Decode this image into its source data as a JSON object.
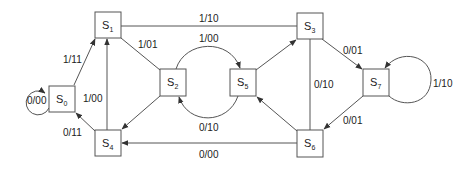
{
  "diagram": {
    "type": "state-transition-diagram",
    "nodes": [
      {
        "id": "S0",
        "letter": "S",
        "index": "0"
      },
      {
        "id": "S1",
        "letter": "S",
        "index": "1"
      },
      {
        "id": "S2",
        "letter": "S",
        "index": "2"
      },
      {
        "id": "S3",
        "letter": "S",
        "index": "3"
      },
      {
        "id": "S4",
        "letter": "S",
        "index": "4"
      },
      {
        "id": "S5",
        "letter": "S",
        "index": "5"
      },
      {
        "id": "S6",
        "letter": "S",
        "index": "6"
      },
      {
        "id": "S7",
        "letter": "S",
        "index": "7"
      }
    ],
    "edges": [
      {
        "from": "S0",
        "to": "S0",
        "label": "0/00"
      },
      {
        "from": "S0",
        "to": "S1",
        "label": "1/11"
      },
      {
        "from": "S4",
        "to": "S0",
        "label": "0/11"
      },
      {
        "from": "S4",
        "to": "S1",
        "label": "1/00"
      },
      {
        "from": "S1",
        "to": "S3",
        "label": "1/10"
      },
      {
        "from": "S1",
        "to": "S2",
        "label": "1/01"
      },
      {
        "from": "S2",
        "to": "S4",
        "label": ""
      },
      {
        "from": "S2",
        "to": "S5",
        "label": "1/00"
      },
      {
        "from": "S5",
        "to": "S2",
        "label": "0/10"
      },
      {
        "from": "S5",
        "to": "S3",
        "label": ""
      },
      {
        "from": "S3",
        "to": "S7",
        "label": "0/01"
      },
      {
        "from": "S6",
        "to": "S3",
        "label": "0/10"
      },
      {
        "from": "S7",
        "to": "S7",
        "label": "1/10"
      },
      {
        "from": "S7",
        "to": "S6",
        "label": "0/01"
      },
      {
        "from": "S6",
        "to": "S5",
        "label": ""
      },
      {
        "from": "S6",
        "to": "S4",
        "label": "0/00"
      }
    ]
  }
}
